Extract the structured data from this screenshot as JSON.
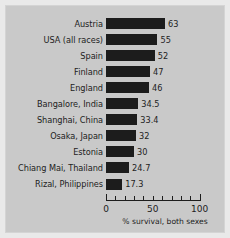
{
  "chart_data": {
    "type": "bar",
    "orientation": "horizontal",
    "title": "",
    "subtitle": "",
    "xlabel": "% survival, both sexes",
    "ylabel": "",
    "xlim": [
      0,
      100
    ],
    "xticks": [
      0,
      50,
      100
    ],
    "xtick_labels": [
      "0",
      "50",
      "100"
    ],
    "minor_tick_step": 10,
    "grid": false,
    "legend": null,
    "bar_color": "#1c1c1c",
    "background_color": "#c9c9c9",
    "text_color": "#1d1d1d",
    "categories": [
      "Austria",
      "USA (all races)",
      "Spain",
      "Finland",
      "England",
      "Bangalore, India",
      "Shanghai, China",
      "Osaka, Japan",
      "Estonia",
      "Chiang Mai, Thailand",
      "Rizal, Philippines"
    ],
    "values": [
      63,
      55,
      52,
      47,
      46,
      34.5,
      33.4,
      32,
      30,
      24.7,
      17.3
    ],
    "value_labels": [
      "63",
      "55",
      "52",
      "47",
      "46",
      "34.5",
      "33.4",
      "32",
      "30",
      "24.7",
      "17.3"
    ]
  }
}
